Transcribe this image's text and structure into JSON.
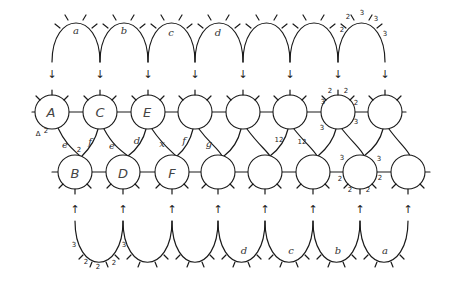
{
  "diagram": {
    "type": "hand-drawn chain of circles with arch/cup gluing",
    "colors": {
      "ink": "#1a1a1a",
      "background": "#ffffff"
    },
    "top_arches": {
      "labels": [
        "a",
        "b",
        "c",
        "d",
        "",
        "",
        ""
      ],
      "annotated_arch_numbers": [
        "2",
        "2",
        "3",
        "3",
        "3"
      ]
    },
    "bottom_cups": {
      "labels": [
        "",
        "",
        "",
        "d",
        "c",
        "b",
        "a"
      ],
      "annotated_cup_numbers": [
        "3",
        "2",
        "2",
        "2",
        "3"
      ]
    },
    "top_row_nodes": [
      "A",
      "C",
      "E",
      "",
      "",
      "",
      "",
      ""
    ],
    "bottom_row_nodes": [
      "B",
      "D",
      "F",
      "",
      "",
      "",
      "",
      ""
    ],
    "edge_labels": {
      "A_B": "e",
      "A_B_end_top": "2",
      "A_B_end_bottom": "2",
      "A_left_mark": "∆",
      "C_B": "f",
      "C_D": "e",
      "E_D": "d",
      "E_F": "x",
      "N4_F": "f",
      "N4_N5b": "g",
      "N6_N5b": "12",
      "N6_N6b": "12",
      "N7_left": "3",
      "N7b_left": "3",
      "N7b_right": "3"
    },
    "node7_top_numbers": [
      "3",
      "2",
      "2",
      "2",
      "3"
    ],
    "node7b_bottom_numbers": [
      "2",
      "2",
      "2",
      "2"
    ],
    "arrows": {
      "top": "↓",
      "bottom": "↑"
    }
  }
}
